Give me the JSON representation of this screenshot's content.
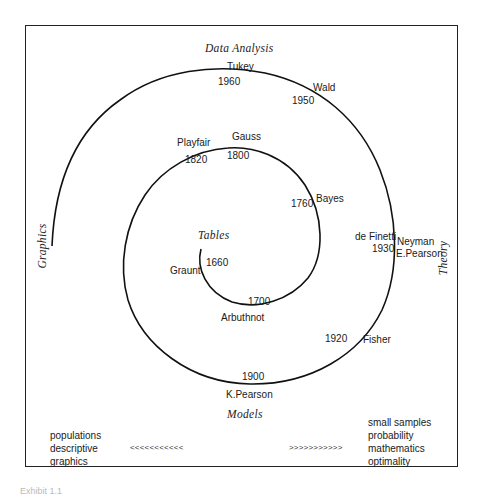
{
  "diagram": {
    "axes": {
      "top": "Data Analysis",
      "left": "Graphics",
      "right": "Theory",
      "bottom": "Models",
      "center": "Tables"
    },
    "milestones": [
      {
        "name": "Graunt",
        "year": "1660"
      },
      {
        "name": "Arbuthnot",
        "year": "1700"
      },
      {
        "name": "Bayes",
        "year": "1760"
      },
      {
        "name": "Gauss",
        "year": "1800"
      },
      {
        "name": "Playfair",
        "year": "1820"
      },
      {
        "name": "K.Pearson",
        "year": "1900"
      },
      {
        "name": "Fisher",
        "year": "1920"
      },
      {
        "name": "de Finetti",
        "year": "1930"
      },
      {
        "name": "Neyman",
        "year": ""
      },
      {
        "name": "E.Pearson",
        "year": ""
      },
      {
        "name": "Wald",
        "year": "1950"
      },
      {
        "name": "Tukey",
        "year": "1960"
      }
    ],
    "bottom_left": {
      "items": [
        "populations",
        "descriptive",
        "graphics"
      ],
      "arrows": "<<<<<<<<<<<"
    },
    "bottom_right": {
      "items": [
        "small samples",
        "probability",
        "mathematics",
        "optimality"
      ],
      "arrows": ">>>>>>>>>>>"
    },
    "caption": "Exhibit 1.1"
  }
}
